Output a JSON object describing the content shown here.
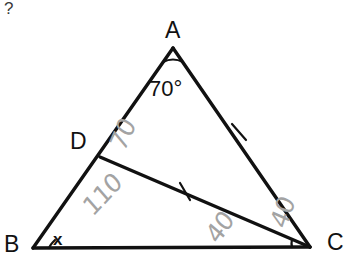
{
  "figure": {
    "type": "geometry-diagram",
    "background_color": "#ffffff",
    "stroke_color": "#111111",
    "handwriting_color": "#a3a3a3",
    "points": {
      "A": {
        "label": "A",
        "x": 173,
        "y": 48
      },
      "B": {
        "label": "B",
        "x": 33,
        "y": 248
      },
      "C": {
        "label": "C",
        "x": 310,
        "y": 247
      },
      "D": {
        "label": "D",
        "x": 100,
        "y": 157
      }
    },
    "segments": [
      {
        "name": "AB",
        "from": "A",
        "to": "B",
        "ticks": 0
      },
      {
        "name": "BC",
        "from": "B",
        "to": "C",
        "ticks": 0
      },
      {
        "name": "AC",
        "from": "A",
        "to": "C",
        "ticks": 1
      },
      {
        "name": "DC",
        "from": "D",
        "to": "C",
        "ticks": 1
      }
    ],
    "angle_arcs": [
      {
        "at": "A",
        "label": "70°"
      },
      {
        "at": "B",
        "label": "x"
      },
      {
        "at": "C",
        "label": ""
      }
    ],
    "printed_labels": {
      "vertex_a": "A",
      "vertex_b": "B",
      "vertex_c": "C",
      "vertex_d": "D",
      "angle_a": "70°",
      "angle_b": "x",
      "corner_mark": "?"
    },
    "handwritten_annotations": [
      {
        "id": "h-70",
        "text": "70",
        "near": "angle ADC interior, above D on segment AB"
      },
      {
        "id": "h-110",
        "text": "110",
        "near": "angle BDC interior, below D"
      },
      {
        "id": "h-40a",
        "text": "40",
        "near": "triangle DBC interior, below segment DC"
      },
      {
        "id": "h-40b",
        "text": "40",
        "near": "angle DCA wedge, left of vertex C"
      }
    ]
  }
}
